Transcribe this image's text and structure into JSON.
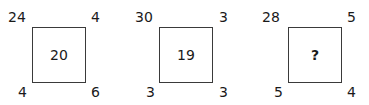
{
  "puzzles": [
    {
      "top_left": "24",
      "top_right": "4",
      "bottom_left": "4",
      "bottom_right": "6",
      "center": "20"
    },
    {
      "top_left": "30",
      "top_right": "3",
      "bottom_left": "3",
      "bottom_right": "3",
      "center": "19"
    },
    {
      "top_left": "28",
      "top_right": "5",
      "bottom_left": "5",
      "bottom_right": "4",
      "center": "?"
    }
  ]
}
